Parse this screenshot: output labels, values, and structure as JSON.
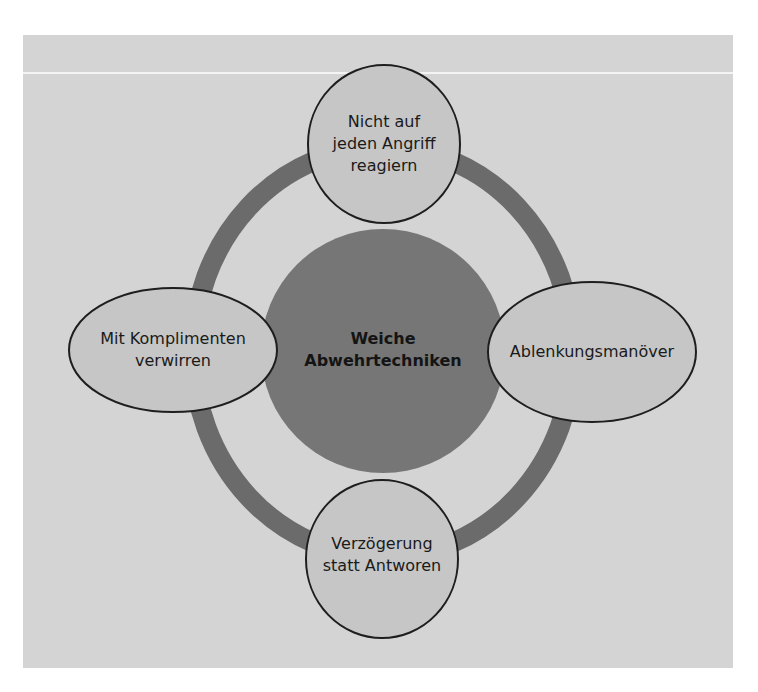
{
  "diagram": {
    "type": "hub-and-spoke cycle",
    "center": {
      "lines": [
        "Weiche",
        "Abwehrtechniken"
      ]
    },
    "nodes": [
      {
        "position": "top",
        "lines": [
          "Nicht auf",
          "jeden Angriff",
          "reagiern"
        ]
      },
      {
        "position": "right",
        "lines": [
          "Ablenkungsmanöver"
        ]
      },
      {
        "position": "bottom",
        "lines": [
          "Verzögerung",
          "statt Antworen"
        ]
      },
      {
        "position": "left",
        "lines": [
          "Mit Komplimenten",
          "verwirren"
        ]
      }
    ]
  },
  "colors": {
    "panel_background": "#d4d4d4",
    "ring": "#6b6b6b",
    "center_fill": "#767676",
    "node_fill": "#c6c6c6",
    "node_stroke": "#1e1e1e",
    "text": "#1a1a1a"
  }
}
